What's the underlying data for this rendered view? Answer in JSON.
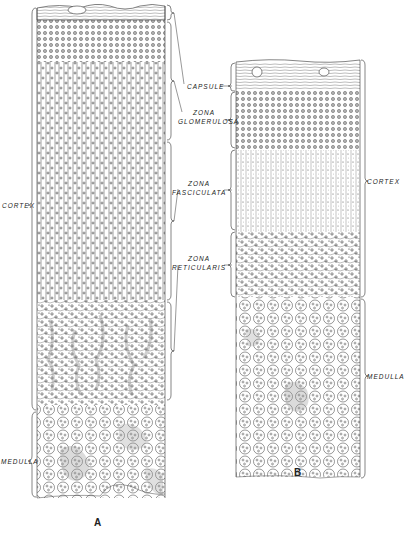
{
  "figure": {
    "panel_a": {
      "letter": "A",
      "left_labels": {
        "cortex": "CORTEX",
        "medulla": "MEDULLA"
      }
    },
    "panel_b": {
      "letter": "B",
      "right_labels": {
        "cortex": "CORTEX",
        "medulla": "MEDULLA"
      }
    },
    "zone_labels": {
      "capsule": "CAPSULE",
      "glomerulosa_1": "ZONA",
      "glomerulosa_2": "GLOMERULOSA",
      "fasciculata_1": "ZONA",
      "fasciculata_2": "FASCICULATA",
      "reticularis_1": "ZONA",
      "reticularis_2": "RETICULARIS"
    },
    "colors": {
      "ink": "#2a2a2a",
      "paper": "#ffffff",
      "shade": "#9a9a9a"
    }
  }
}
